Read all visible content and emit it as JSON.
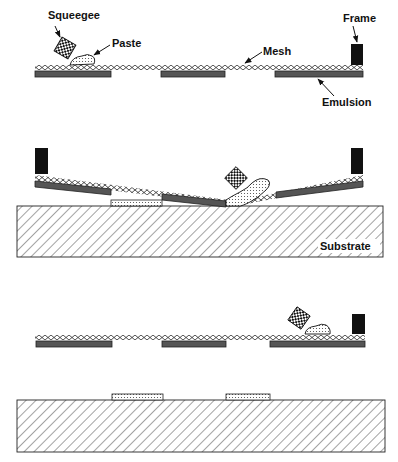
{
  "diagram": {
    "panels": [
      {
        "id": "before-print",
        "description": "Squeegee and paste at start, mesh resting above"
      },
      {
        "id": "during-print",
        "description": "Squeegee deflects mesh onto substrate depositing paste"
      },
      {
        "id": "after-print",
        "description": "Mesh lifted, printed pads remain on substrate"
      }
    ],
    "labels": {
      "squeegee": "Squeegee",
      "paste": "Paste",
      "mesh": "Mesh",
      "frame": "Frame",
      "emulsion": "Emulsion",
      "substrate": "Substrate"
    },
    "colors": {
      "ink": "#111111",
      "emulsion": "#555555",
      "background": "#ffffff"
    }
  }
}
